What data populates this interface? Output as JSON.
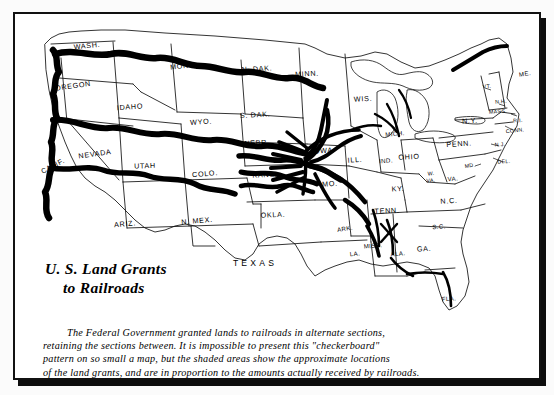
{
  "document": {
    "kind": "printed-map-figure",
    "title_lines": [
      "U. S. Land Grants",
      "to Railroads"
    ],
    "caption_lines": [
      "The Federal Government granted lands to railroads in alternate sections,",
      "retaining the sections between. It is impossible to present this \"checkerboard\"",
      "pattern on so small a map, but the shaded areas show the approximate locations",
      "of the land grants, and are in proportion to the amounts actually received by railroads."
    ],
    "colors": {
      "ink": "#000000",
      "paper": "#ffffff",
      "frame": "#111111",
      "shadow": "#0d0d0d",
      "land_grant_band": "#000000"
    }
  },
  "map": {
    "region": "contiguous united states",
    "state_labels": [
      {
        "id": "wash",
        "text": "WASH.",
        "x": 72,
        "y": 32,
        "rot": -6,
        "size": "normal"
      },
      {
        "id": "oreg",
        "text": "OREGON",
        "x": 58,
        "y": 72,
        "rot": -8,
        "size": "normal"
      },
      {
        "id": "calif",
        "text": "CALIF.",
        "x": 38,
        "y": 152,
        "rot": -28,
        "size": "normal"
      },
      {
        "id": "idaho",
        "text": "IDAHO",
        "x": 115,
        "y": 93,
        "rot": -4,
        "size": "normal"
      },
      {
        "id": "nev",
        "text": "NEVADA",
        "x": 80,
        "y": 140,
        "rot": -8,
        "size": "normal"
      },
      {
        "id": "utah",
        "text": "UTAH",
        "x": 130,
        "y": 152,
        "rot": -2,
        "size": "normal"
      },
      {
        "id": "ariz",
        "text": "ARIZ.",
        "x": 110,
        "y": 210,
        "rot": -5,
        "size": "normal"
      },
      {
        "id": "mont",
        "text": "MONT.",
        "x": 168,
        "y": 52,
        "rot": -7,
        "size": "normal"
      },
      {
        "id": "wyo",
        "text": "WYO.",
        "x": 186,
        "y": 108,
        "rot": -4,
        "size": "normal"
      },
      {
        "id": "colo",
        "text": "COLO.",
        "x": 190,
        "y": 160,
        "rot": -5,
        "size": "normal"
      },
      {
        "id": "nmex",
        "text": "N. MEX.",
        "x": 182,
        "y": 207,
        "rot": -5,
        "size": "normal"
      },
      {
        "id": "ndak",
        "text": "N. DAK.",
        "x": 242,
        "y": 55,
        "rot": -3,
        "size": "normal"
      },
      {
        "id": "sdak",
        "text": "S. DAK.",
        "x": 240,
        "y": 101,
        "rot": -3,
        "size": "normal"
      },
      {
        "id": "nebr",
        "text": "NEBR.",
        "x": 242,
        "y": 129,
        "rot": -3,
        "size": "normal"
      },
      {
        "id": "kans",
        "text": "KANS.",
        "x": 250,
        "y": 161,
        "rot": -3,
        "size": "normal"
      },
      {
        "id": "okla",
        "text": "OKLA.",
        "x": 258,
        "y": 201,
        "rot": -3,
        "size": "normal"
      },
      {
        "id": "texas",
        "text": "TEXAS",
        "x": 240,
        "y": 250,
        "rot": 0,
        "size": "big"
      },
      {
        "id": "minn",
        "text": "MINN.",
        "x": 292,
        "y": 60,
        "rot": -3,
        "size": "normal"
      },
      {
        "id": "iowa",
        "text": "IOWA",
        "x": 307,
        "y": 137,
        "rot": -4,
        "size": "normal"
      },
      {
        "id": "mo",
        "text": "MO.",
        "x": 315,
        "y": 170,
        "rot": -4,
        "size": "normal"
      },
      {
        "id": "ark",
        "text": "ARK.",
        "x": 330,
        "y": 215,
        "rot": -8,
        "size": "sm"
      },
      {
        "id": "la",
        "text": "LA.",
        "x": 340,
        "y": 240,
        "rot": -6,
        "size": "sm"
      },
      {
        "id": "wis",
        "text": "WIS.",
        "x": 348,
        "y": 85,
        "rot": -4,
        "size": "normal"
      },
      {
        "id": "ill",
        "text": "ILL.",
        "x": 340,
        "y": 146,
        "rot": -4,
        "size": "normal"
      },
      {
        "id": "miss",
        "text": "MISS.",
        "x": 358,
        "y": 232,
        "rot": -5,
        "size": "sm"
      },
      {
        "id": "ala",
        "text": "ALA.",
        "x": 383,
        "y": 240,
        "rot": -5,
        "size": "sm"
      },
      {
        "id": "mich",
        "text": "MICH.",
        "x": 380,
        "y": 120,
        "rot": -5,
        "size": "sm"
      },
      {
        "id": "ind",
        "text": "IND.",
        "x": 371,
        "y": 147,
        "rot": -4,
        "size": "sm"
      },
      {
        "id": "ohio",
        "text": "OHIO",
        "x": 394,
        "y": 143,
        "rot": -3,
        "size": "normal"
      },
      {
        "id": "ky",
        "text": "KY.",
        "x": 383,
        "y": 175,
        "rot": -3,
        "size": "normal"
      },
      {
        "id": "tenn",
        "text": "TENN.",
        "x": 372,
        "y": 197,
        "rot": -3,
        "size": "normal"
      },
      {
        "id": "ga",
        "text": "GA.",
        "x": 409,
        "y": 235,
        "rot": -3,
        "size": "normal"
      },
      {
        "id": "fla",
        "text": "FLA.",
        "x": 434,
        "y": 285,
        "rot": -4,
        "size": "sm"
      },
      {
        "id": "sc",
        "text": "S.C.",
        "x": 424,
        "y": 213,
        "rot": -4,
        "size": "sm"
      },
      {
        "id": "nc",
        "text": "N.C.",
        "x": 434,
        "y": 187,
        "rot": -4,
        "size": "normal"
      },
      {
        "id": "wva",
        "text": "W.",
        "x": 416,
        "y": 160,
        "rot": -4,
        "size": "xs"
      },
      {
        "id": "wva2",
        "text": "VA.",
        "x": 416,
        "y": 167,
        "rot": -4,
        "size": "xs"
      },
      {
        "id": "va",
        "text": "VA.",
        "x": 438,
        "y": 165,
        "rot": -4,
        "size": "sm"
      },
      {
        "id": "penn",
        "text": "PENN.",
        "x": 444,
        "y": 130,
        "rot": -4,
        "size": "normal"
      },
      {
        "id": "ny",
        "text": "N.Y.",
        "x": 455,
        "y": 107,
        "rot": -4,
        "size": "normal"
      },
      {
        "id": "md",
        "text": "MD.",
        "x": 455,
        "y": 152,
        "rot": -8,
        "size": "xs"
      },
      {
        "id": "del",
        "text": "DEL.",
        "x": 489,
        "y": 148,
        "rot": -3,
        "size": "xs"
      },
      {
        "id": "nj",
        "text": "N.J.",
        "x": 485,
        "y": 131,
        "rot": -3,
        "size": "xs"
      },
      {
        "id": "conn",
        "text": "CONN.",
        "x": 500,
        "y": 117,
        "rot": -6,
        "size": "xs"
      },
      {
        "id": "ri",
        "text": "R.I.",
        "x": 503,
        "y": 107,
        "rot": -4,
        "size": "xs"
      },
      {
        "id": "mass",
        "text": "MASS.",
        "x": 483,
        "y": 98,
        "rot": -3,
        "size": "xs"
      },
      {
        "id": "nh",
        "text": "N.H.",
        "x": 486,
        "y": 88,
        "rot": -4,
        "size": "xs"
      },
      {
        "id": "vt",
        "text": "VT.",
        "x": 472,
        "y": 73,
        "rot": -5,
        "size": "xs"
      },
      {
        "id": "me",
        "text": "ME.",
        "x": 510,
        "y": 60,
        "rot": -8,
        "size": "sm"
      }
    ]
  }
}
